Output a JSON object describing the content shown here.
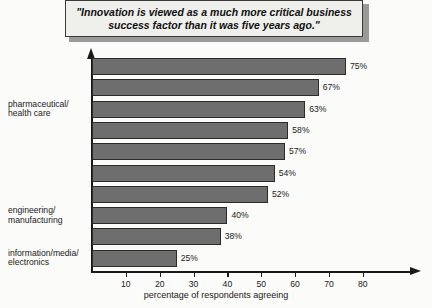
{
  "header": {
    "quote": "\"Innovation is viewed as a much more critical business\nsuccess factor than it was five years ago.\""
  },
  "chart_data": {
    "type": "bar",
    "orientation": "horizontal",
    "title": "",
    "xlabel": "percentage of respondents agreeing",
    "ylabel": "",
    "xlim": [
      0,
      85
    ],
    "grid": false,
    "legend": null,
    "tick_labels": [
      "10",
      "20",
      "30",
      "40",
      "50",
      "60",
      "70",
      "80"
    ],
    "ticks": [
      10,
      20,
      30,
      40,
      50,
      60,
      70,
      80
    ],
    "categories": [
      "financial services",
      "consumer",
      "pharmaceutical/\nhealth care",
      "chemicals",
      "auto",
      "telecom",
      "energy/utilities",
      "engineering/\nmanufacturing",
      "metals/resources",
      "information/media/\nelectronics"
    ],
    "values": [
      75,
      67,
      63,
      58,
      57,
      54,
      52,
      40,
      38,
      25
    ],
    "value_labels": [
      "75%",
      "67%",
      "63%",
      "58%",
      "57%",
      "54%",
      "52%",
      "40%",
      "38%",
      "25%"
    ],
    "bar_color": "#6e6e6e",
    "bar_border_color": "#2b2b2b"
  }
}
